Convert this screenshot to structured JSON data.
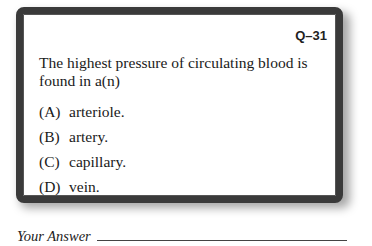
{
  "question_card": {
    "number": "Q–31",
    "stem": "The highest pressure of circulating blood is found in a(n)",
    "options": [
      {
        "letter": "(A)",
        "text": "arteriole."
      },
      {
        "letter": "(B)",
        "text": "artery."
      },
      {
        "letter": "(C)",
        "text": "capillary."
      },
      {
        "letter": "(D)",
        "text": "vein."
      }
    ]
  },
  "answer": {
    "label": "Your Answer",
    "value": ""
  },
  "colors": {
    "frame": "#3a3a3a",
    "card_background": "#ffffff",
    "text": "#1a1a1a"
  }
}
